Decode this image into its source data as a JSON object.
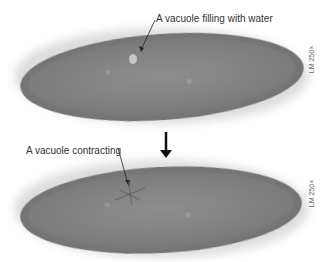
{
  "top_panel": {
    "label": "A vacuole filling with water",
    "scale": "LM 250×"
  },
  "bottom_panel": {
    "label": "A vacuole contracting",
    "scale": "LM 250×"
  },
  "transition": {
    "icon": "down-arrow-icon"
  }
}
